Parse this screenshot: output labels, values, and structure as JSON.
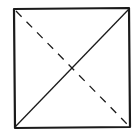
{
  "diagram": {
    "shape": "square",
    "stroke_color": "#1a1a1a",
    "background": "#ffffff",
    "square": {
      "x1": 14,
      "y1": 9,
      "x2": 129,
      "y2": 127
    },
    "diagonals": [
      {
        "name": "solid-diagonal",
        "from": "bottom-left",
        "to": "top-right",
        "style": "solid"
      },
      {
        "name": "dashed-diagonal",
        "from": "top-left",
        "to": "bottom-right",
        "style": "dashed"
      }
    ]
  }
}
